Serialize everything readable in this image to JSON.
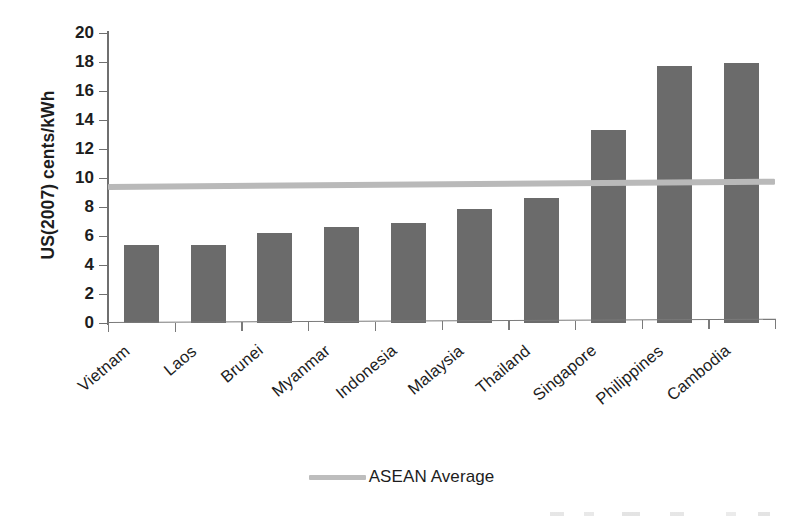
{
  "chart_data": {
    "type": "bar",
    "title": "",
    "subtitle": "",
    "xlabel": "",
    "ylabel": "US(2007) cents/kWh",
    "ylim": [
      0,
      20
    ],
    "yticks": [
      0,
      2,
      4,
      6,
      8,
      10,
      12,
      14,
      16,
      18,
      20
    ],
    "ytick_labels": [
      "0",
      "2",
      "4",
      "6",
      "8",
      "10",
      "12",
      "14",
      "16",
      "18",
      "20"
    ],
    "grid": true,
    "grid_axis": "y",
    "legend_position": "bottom-center",
    "categories": [
      "Vietnam",
      "Laos",
      "Brunei",
      "Myanmar",
      "Indonesia",
      "Malaysia",
      "Thailand",
      "Singapore",
      "Philippines",
      "Cambodia"
    ],
    "values": [
      5.35,
      5.4,
      6.2,
      6.6,
      6.9,
      7.85,
      8.65,
      13.3,
      17.75,
      17.95
    ],
    "bar_color": "#6b6b6b",
    "series": [
      {
        "name": "Electricity tariff",
        "type": "bar",
        "values": [
          5.35,
          5.4,
          6.2,
          6.6,
          6.9,
          7.85,
          8.65,
          13.3,
          17.75,
          17.95
        ]
      },
      {
        "name": "ASEAN Average",
        "type": "line",
        "value": 9.4,
        "color": "#b9b9b9"
      }
    ],
    "annotations": []
  },
  "axis": {
    "y_title": "US(2007) cents/kWh",
    "y_tick_labels": [
      "20",
      "18",
      "16",
      "14",
      "12",
      "10",
      "8",
      "6",
      "4",
      "2",
      "0"
    ]
  },
  "legend": {
    "items": [
      {
        "label": "ASEAN Average",
        "color": "#b9b9b9",
        "marker": "line"
      }
    ]
  }
}
